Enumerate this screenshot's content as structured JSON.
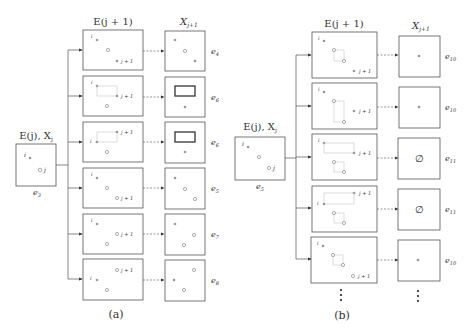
{
  "panel_a": {
    "caption": "(a)",
    "left_box": {
      "title": "E(j), X_j",
      "title_main": "E(j), X",
      "title_sub": "j",
      "label_main": "e",
      "label_sub": "3",
      "point_i": "i",
      "point_j": "j"
    },
    "col_header_E": "E(j + 1)",
    "col_header_X_main": "X",
    "col_header_X_sub": "j+1",
    "rows": [
      {
        "e_main": "e",
        "e_sub": "4",
        "jp1": "j + 1"
      },
      {
        "e_main": "e",
        "e_sub": "6",
        "jp1": "j + 1"
      },
      {
        "e_main": "e",
        "e_sub": "6",
        "jp1": "j + 1"
      },
      {
        "e_main": "e",
        "e_sub": "5",
        "jp1": "j + 1"
      },
      {
        "e_main": "e",
        "e_sub": "7",
        "jp1": "j + 1"
      },
      {
        "e_main": "e",
        "e_sub": "8",
        "jp1": "j + 1"
      }
    ]
  },
  "panel_b": {
    "caption": "(b)",
    "left_box": {
      "title_main": "E(j), X",
      "title_sub": "j",
      "label_main": "e",
      "label_sub": "5",
      "point_i": "i",
      "point_j": "j"
    },
    "col_header_E": "E(j + 1)",
    "col_header_X_main": "X",
    "col_header_X_sub": "j+1",
    "rows": [
      {
        "e_main": "e",
        "e_sub": "10",
        "jp1": "j + 1",
        "x_content": "point"
      },
      {
        "e_main": "e",
        "e_sub": "10",
        "jp1": "j + 1",
        "x_content": "point"
      },
      {
        "e_main": "e",
        "e_sub": "11",
        "jp1": "j + 1",
        "x_content": "∅"
      },
      {
        "e_main": "e",
        "e_sub": "11",
        "jp1": "j + 1",
        "x_content": "∅"
      },
      {
        "e_main": "e",
        "e_sub": "10",
        "jp1": "j + 1",
        "x_content": "point"
      }
    ],
    "continuation": "⋮"
  },
  "colors": {
    "stroke": "#555555",
    "light": "#aaaaaa",
    "dot": "#999999"
  }
}
